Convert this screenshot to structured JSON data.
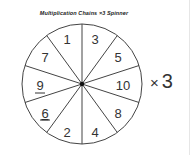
{
  "title": "Multiplication Chains ×3 Spinner",
  "spinner": {
    "sectors_clockwise_from_top": [
      {
        "label": "3",
        "underlined": false
      },
      {
        "label": "5",
        "underlined": false
      },
      {
        "label": "10",
        "underlined": false
      },
      {
        "label": "8",
        "underlined": false
      },
      {
        "label": "4",
        "underlined": false
      },
      {
        "label": "2",
        "underlined": false
      },
      {
        "label": "6",
        "underlined": true
      },
      {
        "label": "9",
        "underlined": true
      },
      {
        "label": "7",
        "underlined": false
      },
      {
        "label": "1",
        "underlined": false
      }
    ]
  },
  "multiplier": {
    "symbol": "×",
    "value": "3"
  }
}
